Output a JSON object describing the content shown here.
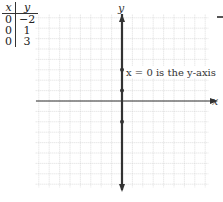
{
  "table": {
    "headers": [
      "x",
      "y"
    ],
    "rows": [
      [
        "0",
        "−2"
      ],
      [
        "0",
        "1"
      ],
      [
        "0",
        "3"
      ]
    ]
  },
  "chart_data": {
    "type": "line",
    "title": "",
    "xlabel": "x",
    "ylabel": "y",
    "annotation": "x = 0 is the y-axis",
    "grid": true,
    "xlim": [
      -8,
      8
    ],
    "ylim": [
      -8,
      8
    ],
    "series": [
      {
        "name": "x = 0",
        "x": [
          0,
          0,
          0
        ],
        "y": [
          -2,
          1,
          3
        ]
      }
    ]
  }
}
